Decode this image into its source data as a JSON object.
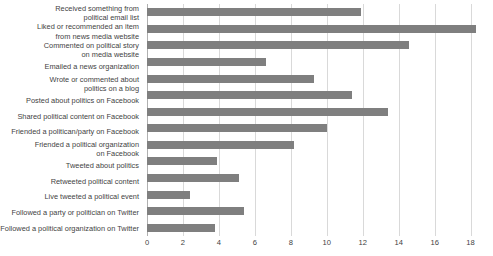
{
  "chart_data": {
    "type": "bar",
    "orientation": "horizontal",
    "title": "",
    "subtitle": "",
    "xlabel": "",
    "ylabel": "",
    "xlim": [
      0,
      18.3
    ],
    "xticks": [
      0,
      2,
      4,
      6,
      8,
      10,
      12,
      14,
      16,
      18
    ],
    "grid": "vertical",
    "legend": "none",
    "bar_color": "#7f7f7f",
    "gridline_color": "#d9d9d9",
    "categories": [
      "Received something from\npolitical email list",
      "Liked or recommended an item\nfrom news media website",
      "Commented on political story\non media website",
      "Emailed a news organization",
      "Wrote or commented about\npolitics on a blog",
      "Posted about politics on Facebook",
      "Shared political content on Facebook",
      "Friended a politican/party on Facebook",
      "Friended a political organization\non Facebook",
      "Tweeted about politics",
      "Retweeted political content",
      "Live tweeted a political event",
      "Followed a party or politician on Twitter",
      "Followed a political organization on Twitter"
    ],
    "values": [
      11.9,
      18.3,
      14.6,
      6.6,
      9.3,
      11.4,
      13.4,
      10.0,
      8.2,
      3.9,
      5.1,
      2.4,
      5.4,
      3.8
    ]
  }
}
